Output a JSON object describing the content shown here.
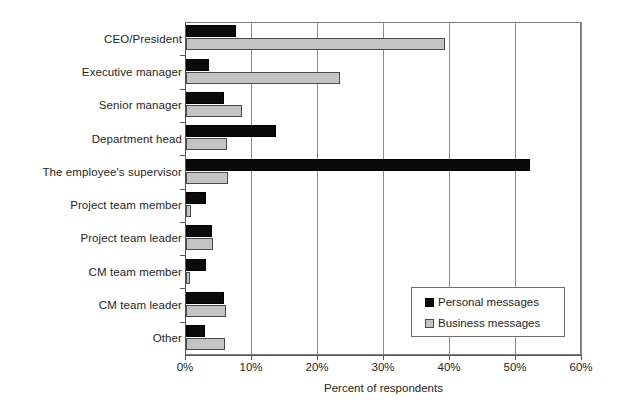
{
  "chart_data": {
    "type": "bar",
    "orientation": "horizontal",
    "title": "",
    "xlabel": "Percent of respondents",
    "ylabel": "",
    "xlim": [
      0,
      60
    ],
    "xticks": [
      "0%",
      "10%",
      "20%",
      "30%",
      "40%",
      "50%",
      "60%"
    ],
    "xtick_values": [
      0,
      10,
      20,
      30,
      40,
      50,
      60
    ],
    "grid": "vertical",
    "legend_position": "inside-lower-right",
    "categories": [
      "CEO/President",
      "Executive manager",
      "Senior manager",
      "Department head",
      "The employee's supervisor",
      "Project team member",
      "Project team leader",
      "CM team member",
      "CM team leader",
      "Other"
    ],
    "series": [
      {
        "name": "Personal messages",
        "color": "#0a0a0a",
        "values": [
          7.6,
          3.5,
          5.7,
          13.7,
          52.1,
          3.1,
          4.0,
          3.1,
          5.8,
          2.9
        ]
      },
      {
        "name": "Business messages",
        "color": "#c4c4c4",
        "values": [
          39.3,
          23.4,
          8.5,
          6.2,
          6.3,
          0.7,
          4.1,
          0.6,
          6.0,
          5.9
        ]
      }
    ]
  },
  "legend": {
    "items": [
      {
        "label": "Personal messages",
        "swatch": "personal"
      },
      {
        "label": "Business messages",
        "swatch": "business"
      }
    ]
  }
}
